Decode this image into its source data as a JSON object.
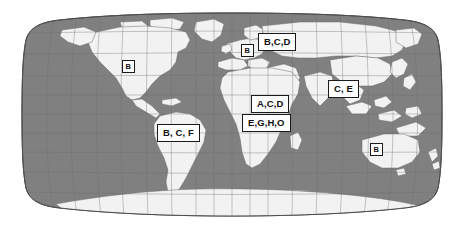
{
  "figure": {
    "name": "world-map-with-region-labels",
    "width": 464,
    "height": 231,
    "projection": "Robinson",
    "background_color": "#ffffff"
  },
  "map": {
    "ocean_color": "#808080",
    "land_color": "#f2f2f2",
    "graticule_color": "#6b6b6b",
    "coastline_color": "#5a5a5a",
    "outline_color": "#4d4d4d",
    "graticule_visible": true,
    "graticule_spacing_degrees": {
      "longitude": 20,
      "latitude": 20
    }
  },
  "labels": [
    {
      "id": "label-north-america",
      "text": "B",
      "region": "North America",
      "size": "sm",
      "x": 122,
      "y": 60,
      "width": 16,
      "height": 13
    },
    {
      "id": "label-europe",
      "text": "B",
      "region": "Europe",
      "size": "sm",
      "x": 241,
      "y": 44,
      "width": 13,
      "height": 12
    },
    {
      "id": "label-northern-eurasia",
      "text": "B,C,D",
      "region": "Northern Eurasia",
      "size": "lg",
      "x": 258,
      "y": 33,
      "width": 38,
      "height": 15
    },
    {
      "id": "label-south-asia",
      "text": "C, E",
      "region": "South and East Asia",
      "size": "lg",
      "x": 328,
      "y": 80,
      "width": 31,
      "height": 15
    },
    {
      "id": "label-north-africa",
      "text": "A,C,D",
      "region": "North Africa and Middle East",
      "size": "lg",
      "x": 251,
      "y": 95,
      "width": 39,
      "height": 15
    },
    {
      "id": "label-sub-saharan-africa",
      "text": "E,G,H,O",
      "region": "Sub-Saharan Africa",
      "size": "lg",
      "x": 242,
      "y": 114,
      "width": 49,
      "height": 15
    },
    {
      "id": "label-south-america",
      "text": "B, C, F",
      "region": "South America",
      "size": "lg",
      "x": 157,
      "y": 124,
      "width": 42,
      "height": 15
    },
    {
      "id": "label-australia",
      "text": "B",
      "region": "Australia",
      "size": "sm",
      "x": 370,
      "y": 143,
      "width": 14,
      "height": 13
    }
  ]
}
